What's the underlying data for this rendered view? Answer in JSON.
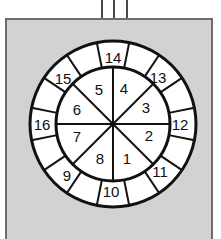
{
  "figure": {
    "type": "segmented-disc-diagram",
    "background_color": "#d3d3d3",
    "panel_border_color": "#6d6d6d",
    "disc_fill": "#ffffff",
    "line_color": "#111111"
  },
  "stem": {
    "name": "stem",
    "lines": 3,
    "color": "#4a4a4a"
  },
  "wheel": {
    "center": {
      "x": 113,
      "y": 124
    },
    "outer_radius": 83,
    "inner_radius": 57,
    "outer_segments": 16,
    "inner_segments": 8,
    "outer_offset_deg": 11.25,
    "inner_labels": [
      "1",
      "2",
      "3",
      "4",
      "5",
      "6",
      "7",
      "8"
    ],
    "outer_labels": [
      "9",
      "10",
      "11",
      "12",
      "13",
      "14",
      "15",
      "16"
    ],
    "inner_label_angles_deg": [
      250,
      290,
      330,
      20,
      65,
      110,
      155,
      200
    ],
    "outer_label_angles_deg": [
      215,
      260,
      305,
      350,
      35,
      80,
      125,
      168
    ],
    "outer_label_positions": [
      {
        "label": "14",
        "x": 113,
        "y": 57
      },
      {
        "label": "13",
        "x": 158,
        "y": 77
      },
      {
        "label": "12",
        "x": 180,
        "y": 124
      },
      {
        "label": "11",
        "x": 160,
        "y": 171
      },
      {
        "label": "10",
        "x": 111,
        "y": 191
      },
      {
        "label": "9",
        "x": 67,
        "y": 175
      },
      {
        "label": "16",
        "x": 42,
        "y": 124
      },
      {
        "label": "15",
        "x": 63,
        "y": 78
      }
    ],
    "inner_label_positions": [
      {
        "label": "4",
        "x": 124,
        "y": 88
      },
      {
        "label": "3",
        "x": 146,
        "y": 107
      },
      {
        "label": "2",
        "x": 149,
        "y": 135
      },
      {
        "label": "1",
        "x": 127,
        "y": 158
      },
      {
        "label": "8",
        "x": 100,
        "y": 158
      },
      {
        "label": "7",
        "x": 77,
        "y": 136
      },
      {
        "label": "6",
        "x": 77,
        "y": 109
      },
      {
        "label": "5",
        "x": 99,
        "y": 89
      }
    ]
  }
}
